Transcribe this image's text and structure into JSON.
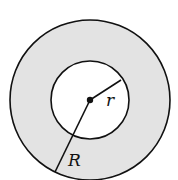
{
  "diagram": {
    "type": "annulus",
    "fill_color": "#e3e3e3",
    "stroke_color": "#111111",
    "inner_fill": "#ffffff",
    "labels": {
      "inner_radius": "r",
      "outer_radius": "R"
    }
  }
}
